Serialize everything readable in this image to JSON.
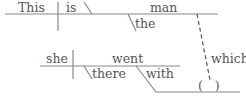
{
  "diagram": {
    "type": "sentence-diagram",
    "main_clause": {
      "subject": "This",
      "verb": "is",
      "predicate_nominative": "man",
      "modifier": "the"
    },
    "relative_clause": {
      "subject": "she",
      "verb": "went",
      "adverb": "there",
      "preposition": "with",
      "relative_pronoun": "which",
      "object_placeholder": "(   )"
    },
    "colors": {
      "line": "#888888",
      "text": "#555555"
    }
  }
}
